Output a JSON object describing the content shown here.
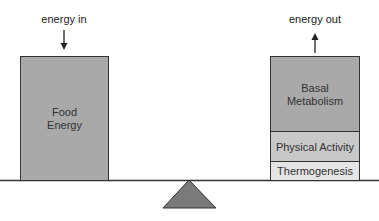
{
  "diagram": {
    "left": {
      "arrow_label": "energy in",
      "arrow_direction": "down",
      "box_label": "Food\nEnergy",
      "color": "#a9a9a9"
    },
    "right": {
      "arrow_label": "energy out",
      "arrow_direction": "up",
      "segments": [
        {
          "label": "Basal\nMetabolism",
          "color": "#a9a9a9"
        },
        {
          "label": "Physical Activity",
          "color": "#c8c8c8"
        },
        {
          "label": "Thermogenesis",
          "color": "#e4e4e4"
        }
      ]
    },
    "fulcrum_color": "#7a7a7a",
    "beam_color": "#333333"
  }
}
